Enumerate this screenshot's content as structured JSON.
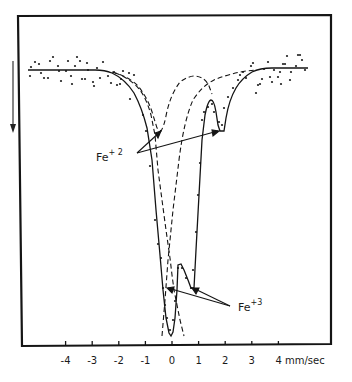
{
  "chart_data": {
    "type": "line",
    "title": "",
    "xlabel": "mm/sec",
    "ylabel": "",
    "xlim": [
      -5.5,
      5.5
    ],
    "grid": false,
    "legend": null,
    "x_ticks": [
      -4,
      -3,
      -2,
      -1,
      0,
      1,
      2,
      3,
      4
    ],
    "x_tick_labels": [
      "-4",
      "-3",
      "-2",
      "-1",
      "0",
      "1",
      "2",
      "3",
      "4 mm/sec"
    ],
    "y_direction_arrow": "down (increasing absorption)",
    "series": [
      {
        "name": "fitted spectrum (solid)",
        "style": "solid",
        "x": [
          -5.4,
          -3.0,
          -2.5,
          -2.0,
          -1.5,
          -1.0,
          -0.8,
          -0.6,
          -0.4,
          -0.2,
          -0.05,
          0.05,
          0.2,
          0.3,
          0.45,
          0.6,
          0.8,
          0.9,
          1.1,
          1.3,
          1.5,
          1.6,
          1.8,
          2.0,
          2.2,
          2.6,
          3.0,
          3.5,
          5.4
        ],
        "relative_transmission": [
          0.0,
          -0.01,
          -0.03,
          -0.08,
          -0.14,
          -0.26,
          -0.34,
          -0.48,
          -0.8,
          -0.96,
          -1.0,
          -0.96,
          -0.72,
          -0.73,
          -0.76,
          -0.8,
          -0.81,
          -0.6,
          -0.22,
          -0.12,
          -0.1,
          -0.13,
          -0.21,
          -0.21,
          -0.14,
          -0.06,
          -0.02,
          0.0,
          0.0
        ]
      },
      {
        "name": "Fe+2 doublet component (dashed)",
        "style": "dashed",
        "x": [
          -2.2,
          -1.4,
          -0.9,
          -0.55,
          -0.35,
          -0.2,
          0.1,
          0.4,
          0.8,
          1.2,
          1.5,
          1.7,
          1.9,
          2.1,
          2.5,
          3.0
        ],
        "relative_transmission": [
          -0.02,
          -0.08,
          -0.18,
          -0.26,
          -0.21,
          -0.1,
          0.01,
          0.02,
          0.0,
          -0.05,
          -0.12,
          -0.2,
          -0.21,
          -0.14,
          -0.05,
          -0.01
        ]
      },
      {
        "name": "Fe+3 component (dashed)",
        "style": "dashed",
        "x": [
          -2.2,
          -1.2,
          -0.6,
          -0.3,
          0.0,
          0.3,
          0.6,
          0.9,
          1.3,
          2.0,
          3.0
        ],
        "relative_transmission": [
          -0.02,
          -0.1,
          -0.3,
          -0.6,
          -0.78,
          -0.62,
          -0.4,
          -0.22,
          -0.08,
          -0.02,
          0.0
        ]
      }
    ],
    "annotations": [
      {
        "text": "Fe",
        "superscript": "+ 2",
        "points_to": [
          -0.35,
          1.8
        ]
      },
      {
        "text": "Fe",
        "superscript": "+3",
        "points_to": [
          0.0,
          0.8
        ]
      }
    ]
  },
  "labels": {
    "fe2_base": "Fe",
    "fe2_sup": "+ 2",
    "fe3_base": "Fe",
    "fe3_sup": "+3",
    "unit": "mm/sec"
  }
}
